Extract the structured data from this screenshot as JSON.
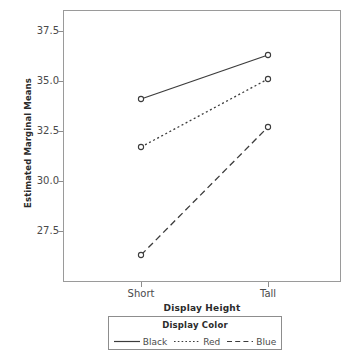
{
  "chart_data": {
    "type": "line",
    "title": "Profile Plots",
    "xlabel": "Display Height",
    "ylabel": "Estimated Marginal Means",
    "categories": [
      "Short",
      "Tall"
    ],
    "ylim": [
      26.0,
      38.5
    ],
    "yticks": [
      27.5,
      30.0,
      32.5,
      35.0,
      37.5
    ],
    "ytick_labels": [
      "27.5",
      "30.0",
      "32.5",
      "35.0",
      "37.5"
    ],
    "grid": false,
    "legend_position": "bottom",
    "legend_title": "Display Color",
    "marker": "open-circle",
    "series": [
      {
        "name": "Black",
        "values": [
          34.1,
          36.3
        ],
        "line_style": "solid",
        "color": "#3c3c3c"
      },
      {
        "name": "Red",
        "values": [
          31.7,
          35.1
        ],
        "line_style": "dotted",
        "color": "#3c3c3c"
      },
      {
        "name": "Blue",
        "values": [
          26.3,
          32.7
        ],
        "line_style": "dashed",
        "color": "#3c3c3c"
      }
    ]
  },
  "axis": {
    "y_title": "Estimated Marginal Means",
    "x_title": "Display Height",
    "y_ticks": [
      {
        "label": "37.5",
        "value": 37.5
      },
      {
        "label": "35.0",
        "value": 35.0
      },
      {
        "label": "32.5",
        "value": 32.5
      },
      {
        "label": "30.0",
        "value": 30.0
      },
      {
        "label": "27.5",
        "value": 27.5
      }
    ],
    "x_ticks": [
      {
        "label": "Short"
      },
      {
        "label": "Tall"
      }
    ]
  },
  "legend": {
    "title": "Display Color",
    "items": [
      {
        "label": "Black",
        "style": "solid"
      },
      {
        "label": "Red",
        "style": "dotted"
      },
      {
        "label": "Blue",
        "style": "dashed"
      }
    ]
  },
  "title": {
    "text": "Profile Plots"
  },
  "colors": {
    "frame": "#9a9a9a",
    "line": "#3c3c3c",
    "text": "#4a4a4a",
    "bold_text": "#2b2b2b",
    "background": "#ffffff"
  }
}
